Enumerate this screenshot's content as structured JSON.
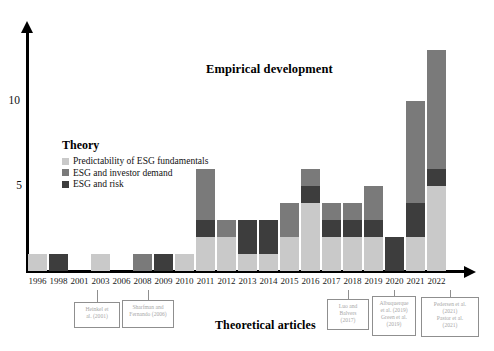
{
  "titles": {
    "empirical": "Empirical development",
    "theoretical": "Theoretical articles"
  },
  "legend": {
    "title": "Theory",
    "items": [
      {
        "label": "Predictability of ESG fundamentals",
        "color": "#c9c9c9",
        "key": "predictability"
      },
      {
        "label": "ESG and investor demand",
        "color": "#7a7a7a",
        "key": "investor_demand"
      },
      {
        "label": "ESG and risk",
        "color": "#3d3d3d",
        "key": "risk"
      }
    ]
  },
  "axis": {
    "y_ticks": [
      "5",
      "10"
    ],
    "y_min": 0,
    "y_max": 13,
    "x_label_color": "#1a1a1a"
  },
  "callouts": [
    {
      "id": "heinkel",
      "text": "Heinkel et al. (2001)",
      "anchor_year": "2001"
    },
    {
      "id": "sharfman",
      "text": "Sharfman and Fernando (2006)",
      "anchor_year": "2006"
    },
    {
      "id": "luo-balvers",
      "text": "Luo and Balvers (2017)",
      "anchor_year": "2017"
    },
    {
      "id": "albuquerque-green",
      "text": "Albuquerque et al. (2019) Green et al. (2019)",
      "anchor_year": "2019"
    },
    {
      "id": "pedersen-pastor",
      "text": "Pedersen et al. (2021) Pastor et al. (2021)",
      "anchor_year": "2021"
    }
  ],
  "chart_data": {
    "type": "bar",
    "stacked": true,
    "title": "Empirical development",
    "xlabel": "Theoretical articles",
    "ylabel": "",
    "ylim": [
      0,
      13
    ],
    "yticks": [
      5,
      10
    ],
    "grid": false,
    "legend_position": "inside-left",
    "categories": [
      "1996",
      "1998",
      "2001",
      "2003",
      "2006",
      "2008",
      "2009",
      "2010",
      "2011",
      "2012",
      "2013",
      "2014",
      "2015",
      "2016",
      "2017",
      "2018",
      "2019",
      "2020",
      "2021",
      "2022"
    ],
    "series": [
      {
        "name": "Predictability of ESG fundamentals",
        "color": "#c9c9c9",
        "values": [
          1,
          0,
          0,
          1,
          0,
          0,
          0,
          1,
          2,
          2,
          1,
          1,
          2,
          4,
          2,
          2,
          2,
          0,
          2,
          5
        ]
      },
      {
        "name": "ESG and risk",
        "color": "#3d3d3d",
        "values": [
          0,
          1,
          0,
          0,
          0,
          0,
          1,
          0,
          1,
          0,
          2,
          2,
          0,
          1,
          1,
          1,
          1,
          2,
          2,
          1
        ]
      },
      {
        "name": "ESG and investor demand",
        "color": "#7a7a7a",
        "values": [
          0,
          0,
          0,
          0,
          0,
          1,
          0,
          0,
          3,
          1,
          0,
          0,
          2,
          1,
          1,
          1,
          2,
          0,
          6,
          7
        ]
      }
    ],
    "totals": [
      1,
      1,
      0,
      1,
      0,
      1,
      1,
      1,
      6,
      3,
      3,
      3,
      4,
      6,
      4,
      4,
      5,
      2,
      10,
      13
    ]
  }
}
